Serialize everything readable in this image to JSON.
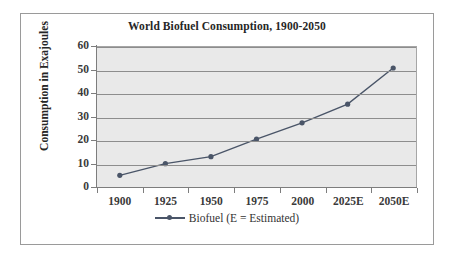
{
  "chart_data": {
    "type": "line",
    "title": "World Biofuel Consumption, 1900-2050",
    "xlabel": "",
    "ylabel": "Consumption in Exajoules",
    "categories": [
      "1900",
      "1925",
      "1950",
      "1975",
      "2000",
      "2025E",
      "2050E"
    ],
    "values": [
      5,
      10,
      13,
      20.5,
      27.5,
      35.5,
      51
    ],
    "series": [
      {
        "name": "Biofuel (E = Estimated)",
        "values": [
          5,
          10,
          13,
          20.5,
          27.5,
          35.5,
          51
        ],
        "color": "#4a5568",
        "marker": "circle"
      }
    ],
    "ylim": [
      0,
      60
    ],
    "yticks": [
      "0",
      "10",
      "20",
      "30",
      "40",
      "50",
      "60"
    ],
    "grid": true,
    "legend_position": "bottom",
    "plot_background": "#e9e9e9"
  },
  "legend": {
    "entries": [
      {
        "label": "Biofuel (E = Estimated)"
      }
    ]
  }
}
